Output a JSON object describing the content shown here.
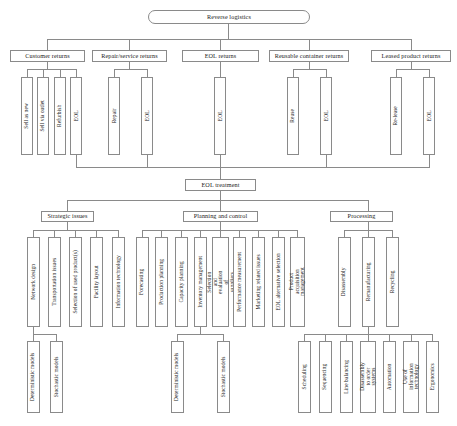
{
  "diagram": {
    "title": "Reverse logistics",
    "type": "hierarchical-tree",
    "root": {
      "label": "Reverse logistics"
    },
    "level1": [
      {
        "label": "Customer returns"
      },
      {
        "label": "Repair/service returns"
      },
      {
        "label": "EOL returns"
      },
      {
        "label": "Reusable container returns"
      },
      {
        "label": "Leased product returns"
      }
    ],
    "level2": {
      "customer_returns": [
        {
          "label": "Sell as new"
        },
        {
          "label": "Sell via outlet"
        },
        {
          "label": "Refurbish"
        },
        {
          "label": "EOL"
        }
      ],
      "repair_service_returns": [
        {
          "label": "Repair"
        },
        {
          "label": "EOL"
        }
      ],
      "eol_returns": [
        {
          "label": "EOL"
        }
      ],
      "reusable_container_returns": [
        {
          "label": "Reuse"
        },
        {
          "label": "EOL"
        }
      ],
      "leased_product_returns": [
        {
          "label": "Re-lease"
        },
        {
          "label": "EOL"
        }
      ]
    },
    "eol_treatment": {
      "label": "EOL treatment"
    },
    "categories": [
      {
        "label": "Strategic issues"
      },
      {
        "label": "Planning and control"
      },
      {
        "label": "Processing"
      }
    ],
    "strategic_issues": {
      "items": [
        {
          "label": "Network design"
        },
        {
          "label": "Transportation issues"
        },
        {
          "label": "Selection of used product(s)"
        },
        {
          "label": "Facility layout"
        },
        {
          "label": "Information technology"
        }
      ],
      "sub_items": [
        {
          "label": "Deterministic models"
        },
        {
          "label": "Stochastic models"
        }
      ]
    },
    "planning_and_control": {
      "items": [
        {
          "label": "Forecasting"
        },
        {
          "label": "Production planning"
        },
        {
          "label": "Capacity planning"
        },
        {
          "label": "Inventory management"
        },
        {
          "label": "Selection and evaluation of suppliers"
        },
        {
          "label": "Performance measurement"
        },
        {
          "label": "Marketing related issues"
        },
        {
          "label": "EOL alternative selection"
        },
        {
          "label": "Product acquisition management"
        }
      ],
      "sub_items": [
        {
          "label": "Deterministic models"
        },
        {
          "label": "Stochastic models"
        }
      ]
    },
    "processing": {
      "items": [
        {
          "label": "Disassembly"
        },
        {
          "label": "Remanufacturing"
        },
        {
          "label": "Recycling"
        }
      ],
      "sub_items": [
        {
          "label": "Scheduling"
        },
        {
          "label": "Sequencing"
        },
        {
          "label": "Line balancing"
        },
        {
          "label": "Disassembly to order systems"
        },
        {
          "label": "Automation"
        },
        {
          "label": "Use of information technology"
        },
        {
          "label": "Ergonomics"
        }
      ]
    },
    "colors": {
      "line": "#8a8a8a",
      "border": "#8a8a8a",
      "background": "#ffffff",
      "text": "#1a1a1a"
    }
  }
}
